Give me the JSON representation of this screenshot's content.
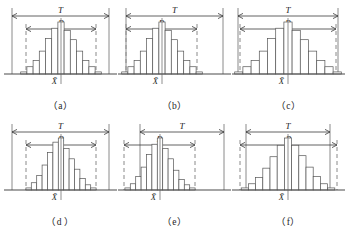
{
  "figure": {
    "colors": {
      "background": "#ffffff",
      "tolerance_line": "#8a8a8a",
      "spread_line": "#8a8a8a",
      "axis": "#4a4a4a",
      "bar_stroke": "#555555",
      "bar_fill": "#ffffff",
      "text": "#1d1d1d"
    },
    "labels": {
      "tolerance": "T",
      "spread": "B",
      "mean": "X̄"
    }
  },
  "chart_data": {
    "type": "bar",
    "xlabel": "",
    "ylabel": "",
    "grid": false,
    "legend": null,
    "shared": {
      "tolerance_label": "T",
      "spread_label": "B",
      "mean_label": "X̄",
      "bin_count": 13
    },
    "panels": [
      {
        "id": "a",
        "caption": "（a）",
        "tolerance_left": 8,
        "tolerance_right": 105,
        "spread_left": 22,
        "spread_right": 92,
        "mean_x": 57,
        "center_x": 57,
        "bin_width": 6.2,
        "values": [
          2,
          7,
          13,
          22,
          34,
          44,
          50,
          42,
          33,
          22,
          13,
          7,
          2
        ],
        "note": "B inside T, centered — capable and centered"
      },
      {
        "id": "b",
        "caption": "（b）",
        "tolerance_left": 8,
        "tolerance_right": 105,
        "spread_left": 8,
        "spread_right": 79,
        "mean_x": 44,
        "center_x": 44,
        "bin_width": 6.2,
        "values": [
          2,
          7,
          13,
          22,
          34,
          44,
          50,
          42,
          33,
          22,
          13,
          7,
          2
        ],
        "note": "B touches left tolerance limit — no left margin"
      },
      {
        "id": "c",
        "caption": "（c）",
        "tolerance_left": 6,
        "tolerance_right": 106,
        "spread_left": 8,
        "spread_right": 104,
        "mean_x": 56,
        "center_x": 56,
        "bin_width": 8.2,
        "values": [
          2,
          7,
          13,
          22,
          34,
          44,
          50,
          42,
          33,
          22,
          13,
          7,
          2
        ],
        "note": "B nearly equals T — marginally capable"
      },
      {
        "id": "d",
        "caption": "（d ）",
        "tolerance_left": 8,
        "tolerance_right": 105,
        "spread_left": 22,
        "spread_right": 92,
        "mean_x": 57,
        "center_x": 57,
        "bin_width": 5.4,
        "values": [
          2,
          7,
          14,
          24,
          36,
          46,
          50,
          40,
          30,
          20,
          11,
          5,
          2
        ],
        "note": "B inside T with narrower distribution"
      },
      {
        "id": "e",
        "caption": "（e）",
        "tolerance_left": 22,
        "tolerance_right": 106,
        "spread_left": 6,
        "spread_right": 77,
        "mean_x": 42,
        "center_x": 42,
        "bin_width": 5.4,
        "values": [
          2,
          6,
          13,
          22,
          34,
          44,
          50,
          40,
          30,
          19,
          10,
          5,
          2
        ],
        "note": "B shifted left past the lower tolerance limit — out of tolerance"
      },
      {
        "id": "f",
        "caption": "（f）",
        "tolerance_left": 14,
        "tolerance_right": 98,
        "spread_left": 8,
        "spread_right": 105,
        "mean_x": 56,
        "center_x": 56,
        "bin_width": 7.2,
        "values": [
          2,
          6,
          12,
          21,
          32,
          43,
          50,
          43,
          33,
          22,
          13,
          6,
          2
        ],
        "note": "B wider than T — not capable"
      }
    ]
  }
}
